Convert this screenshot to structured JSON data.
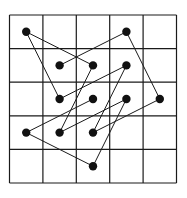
{
  "diagram": {
    "type": "grid-path",
    "grid": {
      "cols": 5,
      "rows": 5,
      "origin_px": [
        9.5,
        15
      ],
      "cell_px": [
        33.4,
        33.6
      ],
      "line_color": "#1a1a1a",
      "line_width": 1.2
    },
    "dots": [
      {
        "col": 0,
        "row": 0
      },
      {
        "col": 3,
        "row": 0
      },
      {
        "col": 1,
        "row": 1
      },
      {
        "col": 2,
        "row": 1
      },
      {
        "col": 3,
        "row": 1
      },
      {
        "col": 1,
        "row": 2
      },
      {
        "col": 2,
        "row": 2
      },
      {
        "col": 3,
        "row": 2
      },
      {
        "col": 4,
        "row": 2
      },
      {
        "col": 0,
        "row": 3
      },
      {
        "col": 1,
        "row": 3
      },
      {
        "col": 2,
        "row": 3
      },
      {
        "col": 2,
        "row": 4
      }
    ],
    "dot_color": "#111111",
    "dot_radius": 4.2,
    "path": [
      [
        1,
        1
      ],
      [
        3,
        0
      ],
      [
        4,
        2
      ],
      [
        2,
        3
      ],
      [
        3,
        1
      ],
      [
        1,
        2
      ],
      [
        0,
        0
      ],
      [
        2,
        1
      ],
      [
        1,
        3
      ],
      [
        3,
        2
      ],
      [
        2,
        4
      ],
      [
        0,
        3
      ],
      [
        2,
        2
      ]
    ],
    "path_color": "#1a1a1a",
    "path_width": 1
  }
}
